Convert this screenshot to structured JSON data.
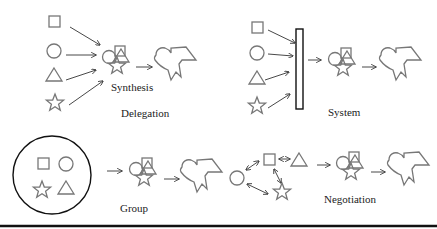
{
  "colors": {
    "shape_stroke": "#777777",
    "arrow_stroke": "#333333",
    "frame_stroke": "#111111",
    "background": "#ffffff"
  },
  "labels": {
    "synthesis": "Synthesis",
    "delegation": "Delegation",
    "system": "System",
    "group": "Group",
    "negotiation": "Negotiation"
  },
  "panels": [
    {
      "name": "delegation",
      "title": "Delegation",
      "inputs": [
        "square",
        "circle",
        "triangle",
        "star"
      ],
      "process": "direct arrows into synthesis",
      "sublabel": "Synthesis"
    },
    {
      "name": "system",
      "title": "System",
      "inputs": [
        "square",
        "circle",
        "triangle",
        "star"
      ],
      "process": "arrows into vertical bar (system)"
    },
    {
      "name": "group",
      "title": "Group",
      "inputs": [
        "square",
        "circle",
        "star",
        "triangle"
      ],
      "process": "shapes enclosed in circle"
    },
    {
      "name": "negotiation",
      "title": "Negotiation",
      "inputs": [
        "circle",
        "square",
        "triangle",
        "star"
      ],
      "process": "bidirectional arrows between shapes"
    }
  ]
}
